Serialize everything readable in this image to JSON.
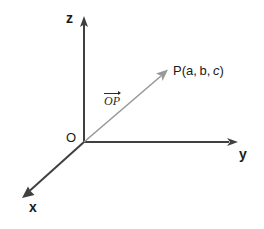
{
  "figure": {
    "width": 264,
    "height": 229,
    "background_color": "#ffffff",
    "axis_color": "#404040",
    "vector_color": "#999999",
    "text_color": "#1a1a1a"
  },
  "axes": {
    "origin_label": "O",
    "z_label": "z",
    "y_label": "y",
    "x_label": "x"
  },
  "vector": {
    "label_text": "OP",
    "notation": "overline-arrow"
  },
  "point": {
    "name": "P",
    "open_paren": "(",
    "coord_a": "a,",
    "coord_b": "b,",
    "coord_c": "c",
    "close_paren": ")",
    "full_label": "P(a, b, c)"
  },
  "caption": {
    "remnant_text": " "
  },
  "geometry": {
    "origin": [
      84,
      142
    ],
    "z_axis_tip": [
      84,
      18
    ],
    "y_axis_tip": [
      236,
      142
    ],
    "x_axis_tip": [
      24,
      196
    ],
    "vector_tip": [
      168,
      70
    ]
  }
}
